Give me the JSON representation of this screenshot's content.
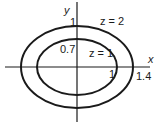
{
  "diagram": {
    "axes": {
      "x_label": "x",
      "y_label": "y"
    },
    "curves": [
      {
        "label": "z = 2",
        "x_intercept": "1.4",
        "y_intercept": "1"
      },
      {
        "label": "z = 1",
        "x_intercept": "1",
        "y_intercept": "0.7"
      }
    ],
    "tick_labels": {
      "outer_y": "1",
      "inner_y": "0.7",
      "inner_x": "1",
      "outer_x": "1.4"
    },
    "colors": {
      "stroke": "#1a1a1a",
      "background": "#ffffff"
    }
  }
}
